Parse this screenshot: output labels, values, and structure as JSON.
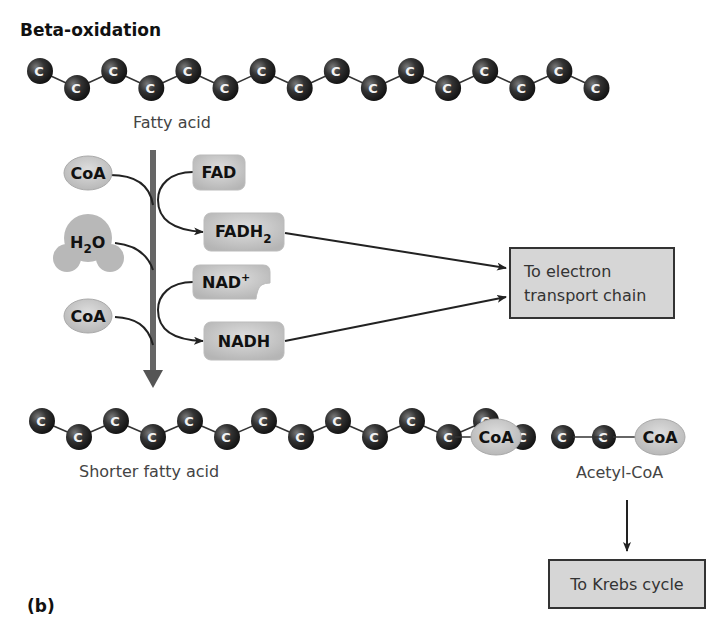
{
  "title": "Beta-oxidation",
  "panel_label": "(b)",
  "colors": {
    "carbon": "#2a2a2a",
    "carbon_highlight": "#6a6a6a",
    "molecule_fill": "#c9c9c9",
    "box_fill": "#d6d6d6",
    "box_border": "#333333",
    "main_arrow": "#666666",
    "line": "#222222"
  },
  "fatty_acid": {
    "label": "Fatty acid",
    "atom_label": "C",
    "carbon_count": 16
  },
  "reactants_left": {
    "coa_1": "CoA",
    "water": "H₂O",
    "water_main": "H",
    "water_sub": "2",
    "water_end": "O",
    "coa_2": "CoA"
  },
  "cofactors": {
    "fad": "FAD",
    "fadh2_main": "FADH",
    "fadh2_sub": "2",
    "nad_main": "NAD",
    "nad_sup": "+",
    "nadh": "NADH"
  },
  "electron_transport_box": {
    "line1": "To electron",
    "line2": "transport chain"
  },
  "shorter_fatty_acid": {
    "label": "Shorter fatty acid",
    "atom_label": "C",
    "carbon_count": 14,
    "terminal": "CoA"
  },
  "acetyl_coa": {
    "label": "Acetyl-CoA",
    "atom_label": "C",
    "carbon_count": 2,
    "terminal": "CoA"
  },
  "krebs_box": {
    "label": "To Krebs cycle"
  }
}
